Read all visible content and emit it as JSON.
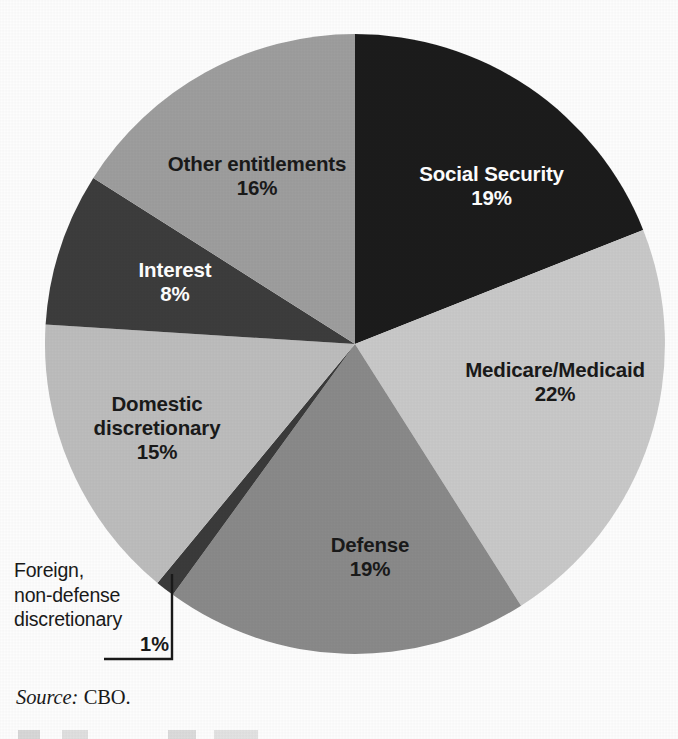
{
  "chart_data": {
    "type": "pie",
    "title": "",
    "subtitle": "",
    "xlabel": "",
    "ylabel": "",
    "legend_position": "none",
    "grid": false,
    "units": "percent",
    "start_angle_deg": 0,
    "direction": "clockwise",
    "categories": [
      "Social Security",
      "Medicare/Medicaid",
      "Defense",
      "Foreign, non-defense discretionary",
      "Domestic discretionary",
      "Interest",
      "Other entitlements"
    ],
    "values": [
      19,
      22,
      19,
      1,
      15,
      8,
      16
    ],
    "slices": [
      {
        "label": "Social Security",
        "value": 19,
        "value_text": "19%",
        "color": "#1e1e1e",
        "text_color": "#ffffff",
        "label_inside": true
      },
      {
        "label": "Medicare/Medicaid",
        "value": 22,
        "value_text": "22%",
        "color": "#c9c9c9",
        "text_color": "#1a1a1a",
        "label_inside": true
      },
      {
        "label": "Defense",
        "value": 19,
        "value_text": "19%",
        "color": "#8a8a8a",
        "text_color": "#1a1a1a",
        "label_inside": true
      },
      {
        "label": "Foreign, non-defense discretionary",
        "value": 1,
        "value_text": "1%",
        "color": "#3a3a3a",
        "text_color": "#1a1a1a",
        "label_inside": false
      },
      {
        "label": "Domestic discretionary",
        "value": 15,
        "value_text": "15%",
        "color": "#bdbdbd",
        "text_color": "#1a1a1a",
        "label_inside": true
      },
      {
        "label": "Interest",
        "value": 8,
        "value_text": "8%",
        "color": "#3c3c3c",
        "text_color": "#ffffff",
        "label_inside": true
      },
      {
        "label": "Other entitlements",
        "value": 16,
        "value_text": "16%",
        "color": "#9e9e9e",
        "text_color": "#1a1a1a",
        "label_inside": true
      }
    ],
    "source": "Source: CBO."
  },
  "labels": {
    "social_security": {
      "name": "Social Security",
      "pct": "19%"
    },
    "medicare": {
      "name": "Medicare/Medicaid",
      "pct": "22%"
    },
    "defense": {
      "name": "Defense",
      "pct": "19%"
    },
    "domestic": {
      "name_line1": "Domestic",
      "name_line2": "discretionary",
      "pct": "15%"
    },
    "interest": {
      "name": "Interest",
      "pct": "8%"
    },
    "other_entitlements": {
      "name": "Other entitlements",
      "pct": "16%"
    },
    "foreign": {
      "line1": "Foreign,",
      "line2": "non-defense",
      "line3": "discretionary",
      "pct": "1%"
    }
  },
  "source": {
    "prefix": "Source:",
    "value": "CBO."
  },
  "colors": {
    "background": "#fdfdfd",
    "social_security": "#1e1e1e",
    "medicare": "#c9c9c9",
    "defense": "#8a8a8a",
    "foreign": "#3a3a3a",
    "domestic": "#bdbdbd",
    "interest": "#3c3c3c",
    "other_entitlements": "#9e9e9e",
    "leader_line": "#1a1a1a"
  }
}
